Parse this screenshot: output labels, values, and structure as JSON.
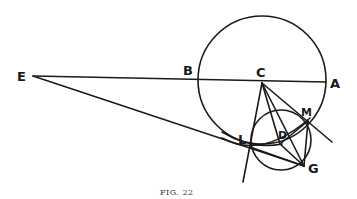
{
  "figure": {
    "caption": "FIG. 22",
    "points": {
      "E": {
        "label": "E",
        "x": 33,
        "y": 76
      },
      "B": {
        "label": "B",
        "x": 198,
        "y": 80
      },
      "C": {
        "label": "C",
        "x": 262,
        "y": 82
      },
      "A": {
        "label": "A",
        "x": 325,
        "y": 82
      },
      "M": {
        "label": "M",
        "x": 308,
        "y": 121
      },
      "L": {
        "label": "L",
        "x": 250,
        "y": 147
      },
      "D": {
        "label": "D",
        "x": 280,
        "y": 144
      },
      "G": {
        "label": "G",
        "x": 304,
        "y": 166
      }
    },
    "circles": {
      "large": {
        "cx": 262,
        "cy": 80,
        "r": 64
      },
      "small": {
        "cx": 281,
        "cy": 140,
        "r": 30
      }
    },
    "stroke_color": "#1a1a1a"
  }
}
